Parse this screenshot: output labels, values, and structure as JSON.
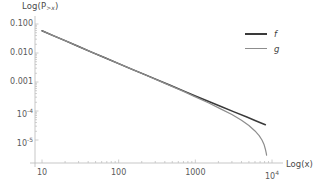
{
  "chart_data": {
    "type": "line",
    "title": "",
    "xlabel": "Log(x)",
    "ylabel": "Log(P>x)",
    "ylabel_base": "Log(P",
    "ylabel_sub": ">x",
    "ylabel_close": ")",
    "scale": "log-log",
    "grid": false,
    "legend_position": "upper-right",
    "xlim": [
      3.2,
      11000
    ],
    "ylim": [
      3e-06,
      0.13
    ],
    "xticks": [
      {
        "value": 10,
        "label": "10"
      },
      {
        "value": 100,
        "label": "100"
      },
      {
        "value": 1000,
        "label": "1000"
      },
      {
        "value": 10000,
        "label": "10",
        "exp": "4"
      }
    ],
    "yticks": [
      {
        "value": 0.1,
        "label": "0.100"
      },
      {
        "value": 0.01,
        "label": "0.010"
      },
      {
        "value": 0.001,
        "label": "0.001"
      },
      {
        "value": 0.0001,
        "label": "10",
        "exp": "-4"
      },
      {
        "value": 1e-05,
        "label": "10",
        "exp": "-5"
      }
    ],
    "series": [
      {
        "name": "f",
        "color": "#3a3a3a",
        "width": 1.5,
        "points": [
          [
            10,
            0.0585
          ],
          [
            14,
            0.0398
          ],
          [
            20,
            0.0268
          ],
          [
            30,
            0.0167
          ],
          [
            45,
            0.0105
          ],
          [
            65,
            0.007
          ],
          [
            100,
            0.0043
          ],
          [
            150,
            0.00272
          ],
          [
            220,
            0.0018
          ],
          [
            320,
            0.00118
          ],
          [
            470,
            0.000772
          ],
          [
            700,
            0.000495
          ],
          [
            1000,
            0.00033
          ],
          [
            1500,
            0.000212
          ],
          [
            2200,
            0.00014
          ],
          [
            3200,
            9.3e-05
          ],
          [
            4700,
            6.18e-05
          ],
          [
            6000,
            4.7e-05
          ],
          [
            7200,
            3.85e-05
          ],
          [
            8200,
            3.35e-05
          ]
        ]
      },
      {
        "name": "g",
        "color": "#8d8d8d",
        "width": 1.2,
        "points": [
          [
            10,
            0.0585
          ],
          [
            14,
            0.0398
          ],
          [
            20,
            0.0268
          ],
          [
            30,
            0.0167
          ],
          [
            45,
            0.0105
          ],
          [
            65,
            0.007
          ],
          [
            100,
            0.0043
          ],
          [
            150,
            0.00272
          ],
          [
            220,
            0.00178
          ],
          [
            320,
            0.00116
          ],
          [
            470,
            0.000752
          ],
          [
            700,
            0.000474
          ],
          [
            1000,
            0.000308
          ],
          [
            1500,
            0.000188
          ],
          [
            2200,
            0.000114
          ],
          [
            3000,
            7.6e-05
          ],
          [
            4000,
            4.8e-05
          ],
          [
            5000,
            3.15e-05
          ],
          [
            6000,
            2.05e-05
          ],
          [
            6800,
            1.42e-05
          ],
          [
            7400,
            1e-05
          ],
          [
            7900,
            6.8e-06
          ],
          [
            8200,
            4.8e-06
          ],
          [
            8400,
            3.6e-06
          ],
          [
            8500,
            3e-06
          ]
        ]
      }
    ]
  },
  "legend": {
    "entries": [
      {
        "label": "f",
        "color": "#3a3a3a"
      },
      {
        "label": "g",
        "color": "#8d8d8d"
      }
    ]
  },
  "axes": {
    "axis_color": "#b9b9b9",
    "tick_color": "#c2c2c2"
  }
}
